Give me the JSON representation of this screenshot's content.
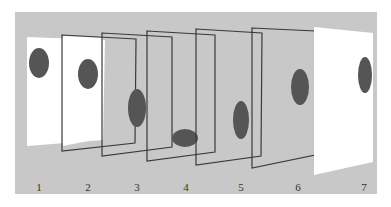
{
  "figure": {
    "background_color": "#c8c8c8",
    "page_color": "#ffffff",
    "frame_stroke_color": "#3a3a3a",
    "blob_color": "#555555",
    "frames": [
      {
        "label": "1",
        "type": "filled-sheet",
        "blob": "upper-left"
      },
      {
        "label": "2",
        "type": "outline-frame",
        "blob": "upper-middle"
      },
      {
        "label": "3",
        "type": "outline-frame",
        "blob": "middle-right-edge"
      },
      {
        "label": "4",
        "type": "outline-frame",
        "blob": "bottom-left-horizontal"
      },
      {
        "label": "5",
        "type": "outline-frame",
        "blob": "lower-right"
      },
      {
        "label": "6",
        "type": "outline-frame",
        "blob": "upper-right"
      },
      {
        "label": "7",
        "type": "filled-sheet",
        "blob": "upper-right"
      }
    ]
  },
  "labels": [
    "1",
    "2",
    "3",
    "4",
    "5",
    "6",
    "7"
  ]
}
